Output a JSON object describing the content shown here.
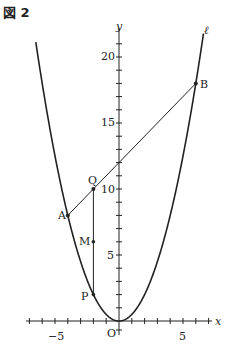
{
  "figure": {
    "title": "図 2"
  },
  "axes": {
    "x_label": "x",
    "y_label": "y",
    "origin_label": "O",
    "x_ticks": [
      -5,
      5
    ],
    "y_ticks": [
      5,
      10,
      15,
      20
    ],
    "x_tick_labels": [
      "−5",
      "5"
    ],
    "y_tick_labels": [
      "5",
      "10",
      "15",
      "20"
    ]
  },
  "curve": {
    "label": "ℓ",
    "equation": "y = x²/2"
  },
  "points": {
    "A": {
      "label": "A",
      "x": -4,
      "y": 8
    },
    "B": {
      "label": "B",
      "x": 6,
      "y": 18
    },
    "Q": {
      "label": "Q",
      "x": -2,
      "y": 10
    },
    "M": {
      "label": "M",
      "x": -2,
      "y": 6
    },
    "P": {
      "label": "P",
      "x": -2,
      "y": 2
    }
  },
  "colors": {
    "ink": "#222222",
    "background": "#ffffff"
  }
}
